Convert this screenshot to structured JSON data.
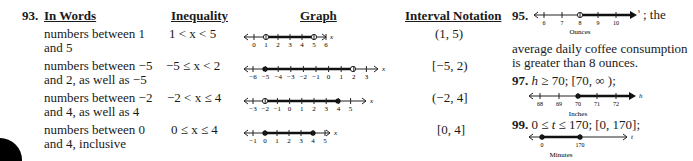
{
  "problem93": {
    "number": "93.",
    "headers": {
      "words": "In Words",
      "inequality": "Inequality",
      "graph": "Graph",
      "interval": "Interval Notation"
    },
    "rows": [
      {
        "words_line1": "numbers between 1",
        "words_line2": "and 5",
        "inequality": "1 < x < 5",
        "interval": "(1, 5)",
        "graph": {
          "ticks": [
            0,
            1,
            2,
            3,
            4,
            5,
            6
          ],
          "left": 1,
          "left_closed": false,
          "right": 5,
          "right_closed": false,
          "variable": "x"
        }
      },
      {
        "words_line1": "numbers between −5",
        "words_line2": "and 2, as well as −5",
        "inequality": "−5 ≤ x < 2",
        "interval": "[−5, 2)",
        "graph": {
          "ticks": [
            -6,
            -5,
            -4,
            -3,
            -2,
            -1,
            0,
            1,
            2,
            3
          ],
          "left": -5,
          "left_closed": true,
          "right": 2,
          "right_closed": false,
          "variable": "x"
        }
      },
      {
        "words_line1": "numbers between −2",
        "words_line2": "and 4, as well as 4",
        "inequality": "−2 < x ≤ 4",
        "interval": "(−2, 4]",
        "graph": {
          "ticks": [
            -3,
            -2,
            -1,
            0,
            1,
            2,
            3,
            4,
            5
          ],
          "left": -2,
          "left_closed": false,
          "right": 4,
          "right_closed": true,
          "variable": "x"
        }
      },
      {
        "words_line1": "numbers between 0",
        "words_line2": "and 4, inclusive",
        "inequality": "0 ≤ x ≤ 4",
        "interval": "[0, 4]",
        "graph": {
          "ticks": [
            -1,
            0,
            1,
            2,
            3,
            4,
            5
          ],
          "left": 0,
          "left_closed": true,
          "right": 4,
          "right_closed": true,
          "variable": "x"
        }
      }
    ]
  },
  "problem95": {
    "number": "95.",
    "graph": {
      "ticks": [
        6,
        7,
        8,
        9,
        10
      ],
      "start": 8,
      "start_closed": false,
      "direction": "right",
      "variable": "w",
      "unit_label": "Ounces"
    },
    "text_inline": "; the",
    "text_line2": "average daily coffee consumption",
    "text_line3": "is greater than 8 ounces."
  },
  "problem97": {
    "number": "97.",
    "var": "h",
    "statement": " ≥ 70; [70, ∞ );",
    "graph": {
      "ticks": [
        68,
        69,
        70,
        71,
        72
      ],
      "start": 70,
      "start_closed": true,
      "direction": "right",
      "variable": "h",
      "unit_label": "Inches"
    }
  },
  "problem99": {
    "number": "99.",
    "statement_a": "0 ≤ ",
    "var": "t",
    "statement_b": " ≤ 170; [0, 170];",
    "graph": {
      "ticks": [
        0,
        170
      ],
      "left": 0,
      "right": 170,
      "left_closed": true,
      "right_closed": true,
      "variable": "t",
      "unit_label": "Minutes"
    }
  }
}
